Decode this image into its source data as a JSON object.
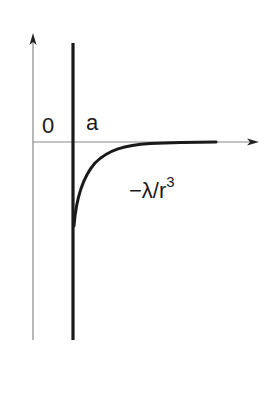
{
  "diagram": {
    "type": "potential-energy-curve",
    "labels": {
      "origin": "0",
      "wall_position": "a",
      "potential_main": "−λ/r",
      "potential_exponent": "3"
    },
    "axes": {
      "x_axis": {
        "from": [
          33,
          142
        ],
        "to": [
          258,
          142
        ],
        "arrow": true
      },
      "y_axis": {
        "from": [
          33,
          340
        ],
        "to": [
          33,
          35
        ],
        "arrow": true
      }
    },
    "wall": {
      "x": 73,
      "y_top": 43,
      "y_bottom": 340
    },
    "curve": {
      "description": "Attractive potential −λ/r^3 for r > a, starting deep at the wall and approaching zero",
      "start": [
        73,
        225
      ],
      "end": [
        216,
        142
      ]
    },
    "colors": {
      "axis": "#888888",
      "wall": "#1a1a1a",
      "curve": "#1a1a1a",
      "text": "#1a1a1a"
    }
  }
}
